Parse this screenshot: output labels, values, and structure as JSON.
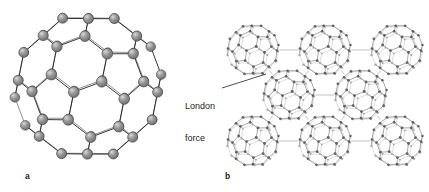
{
  "figure": {
    "background_color": "#ffffff",
    "width": 429,
    "height": 192,
    "panels": [
      {
        "id": "a",
        "label": "a",
        "caption": "",
        "subject": "buckminsterfullerene-molecule",
        "style": "ball-and-stick",
        "description": "Single C60 buckyball drawn as shaded grey spheres joined by thin black bonds",
        "center": {
          "x": 88,
          "y": 86
        },
        "radius": 74,
        "atom_color": "#8c8c8c",
        "atom_highlight_color": "#c9c9c9",
        "atom_outline_color": "#444444",
        "bond_color": "#2b2b2b",
        "atom_count": 60
      },
      {
        "id": "b",
        "label": "b",
        "caption": "",
        "subject": "fullerene-crystal-lattice",
        "style": "wireframe",
        "description": "Eight C60 molecules packed in a close-packed array, linked by faint contact lines representing intermolecular attraction",
        "molecule_color": "#6e6e6e",
        "contact_line_color": "#a9a9a9",
        "molecule_radius": 26,
        "molecules": [
          {
            "row": "top",
            "cx": 253,
            "cy": 50
          },
          {
            "row": "top",
            "cx": 325,
            "cy": 50
          },
          {
            "row": "top",
            "cx": 397,
            "cy": 50
          },
          {
            "row": "middle",
            "cx": 289,
            "cy": 95
          },
          {
            "row": "middle",
            "cx": 361,
            "cy": 95
          },
          {
            "row": "bottom",
            "cx": 253,
            "cy": 141
          },
          {
            "row": "bottom",
            "cx": 325,
            "cy": 141
          },
          {
            "row": "bottom",
            "cx": 397,
            "cy": 141
          }
        ]
      }
    ],
    "annotations": [
      {
        "id": "london-force",
        "text_line1": "London",
        "text_line2": "force",
        "text_color": "#231f20",
        "font_size_px": 9,
        "leader_line": {
          "from": {
            "x": 222,
            "y": 88
          },
          "to": {
            "x": 266,
            "y": 74
          },
          "color": "#231f20",
          "width": 0.8
        }
      }
    ]
  }
}
